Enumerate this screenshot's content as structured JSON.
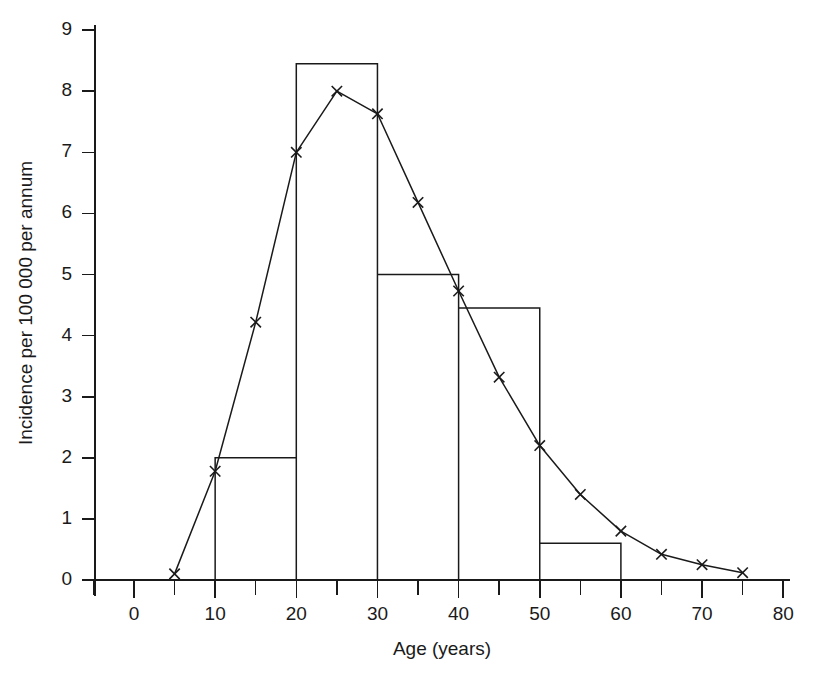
{
  "chart_data": {
    "type": "bar",
    "title": "",
    "xlabel": "Age (years)",
    "ylabel": "Incidence per 100 000 per annum",
    "xlim": [
      -5,
      82
    ],
    "ylim": [
      0,
      9
    ],
    "grid": false,
    "legend": "none",
    "x_ticks_major": [
      0,
      10,
      20,
      30,
      40,
      50,
      60,
      70,
      80
    ],
    "x_tick_labels": [
      "0",
      "10",
      "20",
      "30",
      "40",
      "50",
      "60",
      "70",
      "80"
    ],
    "x_ticks_minor": [
      -5,
      5,
      15,
      25,
      35,
      45,
      55,
      65,
      75
    ],
    "y_ticks": [
      0,
      1,
      2,
      3,
      4,
      5,
      6,
      7,
      8,
      9
    ],
    "y_tick_labels": [
      "0",
      "1",
      "2",
      "3",
      "4",
      "5",
      "6",
      "7",
      "8",
      "9"
    ],
    "histogram": {
      "name": "Age-group incidence (histogram)",
      "bin_edges": [
        10,
        20,
        30,
        40,
        50,
        60
      ],
      "bin_labels": [
        "10-20",
        "20-30",
        "30-40",
        "40-50",
        "50-60"
      ],
      "values": [
        2.0,
        8.45,
        5.0,
        4.45,
        0.6
      ]
    },
    "series": [
      {
        "name": "Smoothed age-specific incidence",
        "marker": "x",
        "x": [
          5,
          10,
          15,
          20,
          25,
          30,
          35,
          40,
          45,
          50,
          55,
          60,
          65,
          70,
          75
        ],
        "values": [
          0.1,
          1.78,
          4.22,
          7.0,
          8.0,
          7.63,
          6.18,
          4.73,
          3.32,
          2.2,
          1.4,
          0.8,
          0.42,
          0.25,
          0.12
        ]
      }
    ]
  },
  "axes": {
    "y_axis_title": "Incidence per 100 000 per annum",
    "x_axis_title": "Age (years)"
  }
}
